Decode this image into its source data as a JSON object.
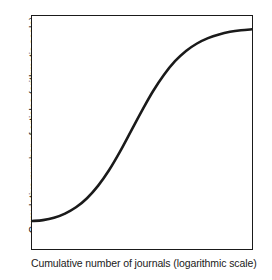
{
  "figure": {
    "name": "bradford-law-cumulative-distribution"
  },
  "axes": {
    "x_label": "Cumulative number of journals (logarithmic scale)",
    "y_label": "Cumulative number of articles (arithmetic scale)"
  },
  "style": {
    "curve_color": "#1a1a1a",
    "frame_color": "#1a1a1a",
    "background_color": "#ffffff",
    "curve_width_px": 2.6,
    "frame_width_px": 1.5
  },
  "chart_data": {
    "type": "line",
    "title": "",
    "subtitle": "",
    "xlabel": "Cumulative number of journals (logarithmic scale)",
    "ylabel": "Cumulative number of articles (arithmetic scale)",
    "xscale": "log",
    "yscale": "linear",
    "grid": false,
    "legend": false,
    "xticks": [],
    "yticks": [],
    "xtick_labels": [],
    "ytick_labels": [],
    "xlim": [
      0,
      100
    ],
    "ylim": [
      0,
      100
    ],
    "annotations": [],
    "series": [
      {
        "name": "Cumulative articles vs. cumulative journals",
        "shape": "sigmoid",
        "x": [
          0,
          5,
          10,
          15,
          20,
          25,
          30,
          35,
          40,
          45,
          50,
          55,
          60,
          65,
          70,
          75,
          80,
          85,
          90,
          95,
          100
        ],
        "y": [
          12,
          12.4,
          13.4,
          15.2,
          17.9,
          21.8,
          27.1,
          33.8,
          41.8,
          50.6,
          59.4,
          67.7,
          74.8,
          80.6,
          85.0,
          88.2,
          90.5,
          92.1,
          93.2,
          93.9,
          94.3
        ]
      }
    ]
  }
}
